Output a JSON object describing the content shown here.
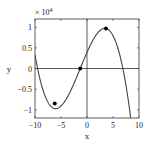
{
  "chart_data": {
    "type": "line",
    "title": "",
    "xlabel": "x",
    "ylabel": "y",
    "y_multiplier_label": "× 10",
    "y_multiplier_exp": "4",
    "xlim": [
      -10,
      10
    ],
    "ylim": [
      -1.2,
      1.2
    ],
    "y_scale": 10000,
    "xticks": [
      -10,
      -5,
      0,
      5,
      10
    ],
    "xtick_labels": [
      "−10",
      "−5",
      "0",
      "5",
      "10"
    ],
    "yticks": [
      -1,
      -0.5,
      0,
      0.5,
      1
    ],
    "ytick_labels": [
      "−1",
      "−0.5",
      "0",
      "0.5",
      "1"
    ],
    "grid": false,
    "zero_lines": true,
    "series": [
      {
        "name": "cubic",
        "description": "y = -a(x+9.5)(x+1.3)(x-6.9), y in units of 10^4",
        "roots": [
          -9.5,
          -1.3,
          6.9
        ],
        "coefficient": 0.00459,
        "x_sample": [
          -10,
          -9,
          -8,
          -7,
          -6.2,
          -5,
          -4,
          -3,
          -2,
          -1.3,
          -1,
          0,
          1,
          2,
          3,
          3.65,
          4,
          5,
          6,
          7,
          8,
          8.65
        ],
        "y_sample": [
          0.14,
          -0.16,
          -0.46,
          -0.71,
          -0.85,
          -0.78,
          -0.64,
          -0.42,
          -0.15,
          0.0,
          0.06,
          0.39,
          0.68,
          0.87,
          0.96,
          0.97,
          0.96,
          0.79,
          0.43,
          -0.13,
          -0.88,
          -1.2
        ]
      }
    ],
    "markers": [
      {
        "label": "local minimum",
        "x": -6.2,
        "y": -0.85
      },
      {
        "label": "inflection point",
        "x": -1.3,
        "y": 0.0
      },
      {
        "label": "local maximum",
        "x": 3.65,
        "y": 0.97
      }
    ]
  }
}
